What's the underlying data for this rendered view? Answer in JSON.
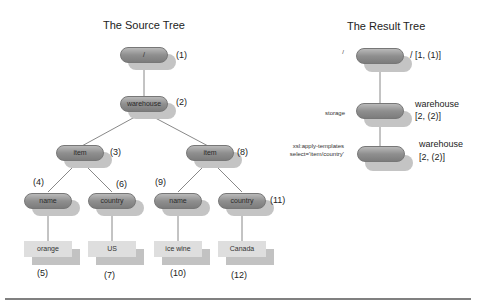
{
  "source_tree": {
    "title": "The Source Tree",
    "nodes": {
      "root": {
        "label": "/",
        "index": "(1)"
      },
      "warehouse": {
        "label": "warehouse",
        "index": "(2)"
      },
      "item1": {
        "label": "item",
        "index": "(3)"
      },
      "name1": {
        "label": "name",
        "index": "(4)"
      },
      "text_orange": {
        "label": "orange",
        "index": "(5)"
      },
      "country1": {
        "label": "country",
        "index": "(6)"
      },
      "text_us": {
        "label": "US",
        "index": "(7)"
      },
      "item2": {
        "label": "item",
        "index": "(8)"
      },
      "name2": {
        "label": "name",
        "index": "(9)"
      },
      "text_icewine": {
        "label": "ice wine",
        "index": "(10)"
      },
      "country2": {
        "label": "country",
        "index": "(11)"
      },
      "text_canada": {
        "label": "Canada",
        "index": "(12)"
      }
    }
  },
  "result_tree": {
    "title": "The Result Tree",
    "nodes": [
      {
        "left_label": "/",
        "label": "",
        "right_label": "/ [1, (1)]"
      },
      {
        "left_label": "storage",
        "label": "",
        "right_label_1": "warehouse",
        "right_label_2": "[2, (2)]"
      },
      {
        "left_label_1": "xsl:apply-templates",
        "left_label_2": "select='item/country'",
        "label": "",
        "right_label_1": "warehouse",
        "right_label_2": "[2, (2)]"
      }
    ]
  },
  "colors": {
    "pill": "#8f8f8f",
    "shadow": "#c4c4c4",
    "text_box": "#dedede",
    "rule": "#808080"
  }
}
